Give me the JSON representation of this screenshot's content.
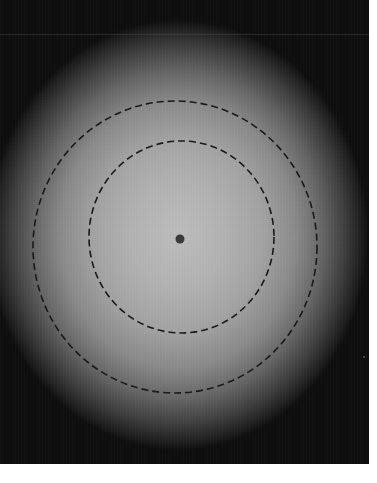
{
  "image": {
    "description": "Blurred circular brightness distribution on dark background with two dashed elliptical contours and a central dark dot",
    "width": 369,
    "height": 464,
    "colors": {
      "center": "#bdbdbd",
      "edge": "#0e0e0e",
      "contour": "#1a1a1a",
      "dot": "#3a3a3a",
      "margin": "#ffffff"
    },
    "contours": [
      {
        "name": "outer",
        "cx": 175,
        "cy": 247,
        "rx": 142,
        "ry": 146,
        "style": "dashed"
      },
      {
        "name": "inner",
        "cx": 181.5,
        "cy": 237,
        "rx": 92.5,
        "ry": 96,
        "style": "dashed"
      }
    ],
    "center_dot": {
      "cx": 180,
      "cy": 239,
      "r": 4.5
    }
  }
}
